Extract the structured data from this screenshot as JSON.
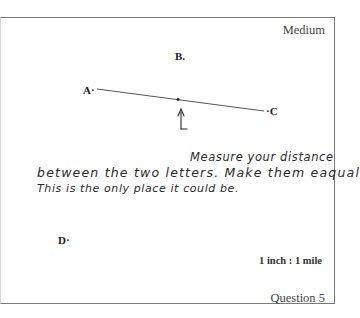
{
  "page": {
    "difficulty": "Medium",
    "question": "Question 5",
    "scale": "1 inch : 1 mile"
  },
  "points": {
    "a": "A",
    "b": "B",
    "c": "C",
    "d": "D"
  },
  "annotation": {
    "line1": "Measure your distance",
    "line2": "between the two letters. Make them eaqual",
    "line3": "This is the only place it could be."
  },
  "colors": {
    "border": "#7a7a7a",
    "ink": "#2a2a2a",
    "text": "#333333"
  }
}
